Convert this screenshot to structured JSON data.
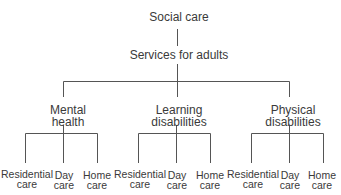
{
  "diagram": {
    "root": "Social care",
    "level1": "Services for adults",
    "branches": [
      {
        "line1": "Mental",
        "line2": "health",
        "leaves": [
          {
            "l1": "Residential",
            "l2": "care"
          },
          {
            "l1": "Day",
            "l2": "care"
          },
          {
            "l1": "Home",
            "l2": "care"
          }
        ]
      },
      {
        "line1": "Learning",
        "line2": "disabilities",
        "leaves": [
          {
            "l1": "Residential",
            "l2": "care"
          },
          {
            "l1": "Day",
            "l2": "care"
          },
          {
            "l1": "Home",
            "l2": "care"
          }
        ]
      },
      {
        "line1": "Physical",
        "line2": "disabilities",
        "leaves": [
          {
            "l1": "Residential",
            "l2": "care"
          },
          {
            "l1": "Day",
            "l2": "care"
          },
          {
            "l1": "Home",
            "l2": "care"
          }
        ]
      }
    ],
    "line_color": "#555555"
  }
}
